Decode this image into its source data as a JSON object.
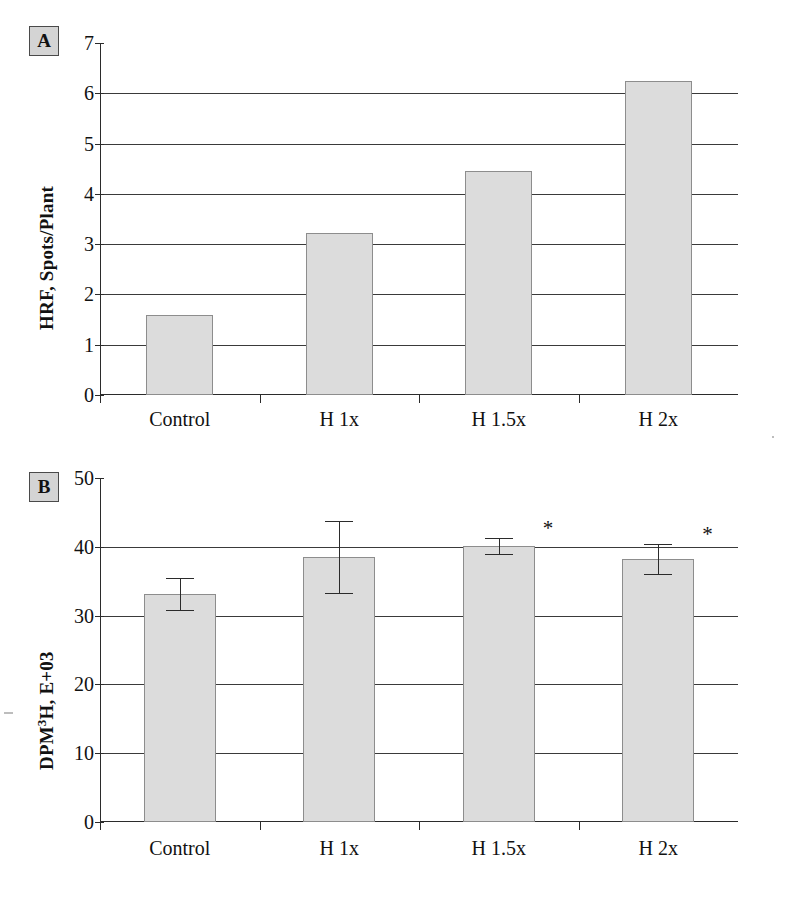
{
  "figure": {
    "background_color": "#ffffff",
    "bar_fill_color": "#dcdcdc",
    "bar_border_color": "#8d8d8d",
    "axis_color": "#2b2b2b"
  },
  "panels": [
    {
      "id": "A",
      "label": "A",
      "chart": {
        "type": "bar",
        "title": "",
        "subtitle": "",
        "xlabel": "",
        "ylabel": "HRF, Spots/Plant",
        "ylabel_html": "HRF, Spots/Plant",
        "categories": [
          "Control",
          "H 1x",
          "H 1.5x",
          "H 2x"
        ],
        "values": [
          1.6,
          3.22,
          4.45,
          6.25
        ],
        "series": [
          {
            "name": "HRF",
            "values": [
              1.6,
              3.22,
              4.45,
              6.25
            ]
          }
        ],
        "errors": null,
        "ylim": [
          0,
          7
        ],
        "ytick_values": [
          0,
          1,
          2,
          3,
          4,
          5,
          6,
          7
        ],
        "ytick_labels": [
          "0",
          "1",
          "2",
          "3",
          "4",
          "5",
          "6",
          "7"
        ],
        "grid": true,
        "grid_axis": "y",
        "legend": false,
        "legend_position": "none",
        "annotations": []
      }
    },
    {
      "id": "B",
      "label": "B",
      "chart": {
        "type": "bar",
        "title": "",
        "subtitle": "",
        "xlabel": "",
        "ylabel": "DPM3H, E+03",
        "ylabel_prefix": "DPM",
        "ylabel_superscript": "3",
        "ylabel_suffix": "H, E+03",
        "categories": [
          "Control",
          "H 1x",
          "H 1.5x",
          "H 2x"
        ],
        "values": [
          33.1,
          38.5,
          40.1,
          38.2
        ],
        "series": [
          {
            "name": "DPM 3H",
            "values": [
              33.1,
              38.5,
              40.1,
              38.2
            ]
          }
        ],
        "errors": [
          2.3,
          5.2,
          1.2,
          2.2
        ],
        "error_upper": [
          35.4,
          43.7,
          41.3,
          40.4
        ],
        "error_lower": [
          30.8,
          33.3,
          38.9,
          36.0
        ],
        "ylim": [
          0,
          50
        ],
        "ytick_values": [
          0,
          10,
          20,
          30,
          40,
          50
        ],
        "ytick_labels": [
          "0",
          "10",
          "20",
          "30",
          "40",
          "50"
        ],
        "grid": true,
        "grid_axis": "y",
        "legend": false,
        "legend_position": "none",
        "significance_marker": "*",
        "significance_categories": [
          "H 1.5x",
          "H 2x"
        ],
        "annotations": [
          {
            "text": "*",
            "category": "H 1.5x"
          },
          {
            "text": "*",
            "category": "H 2x"
          }
        ]
      }
    }
  ],
  "chart_data": [
    {
      "type": "bar",
      "panel": "A",
      "categories": [
        "Control",
        "H 1x",
        "H 1.5x",
        "H 2x"
      ],
      "values": [
        1.6,
        3.22,
        4.45,
        6.25
      ],
      "title": "",
      "xlabel": "",
      "ylabel": "HRF, Spots/Plant",
      "ylim": [
        0,
        7
      ],
      "yticks": [
        0,
        1,
        2,
        3,
        4,
        5,
        6,
        7
      ],
      "grid": true,
      "legend": "none"
    },
    {
      "type": "bar",
      "panel": "B",
      "categories": [
        "Control",
        "H 1x",
        "H 1.5x",
        "H 2x"
      ],
      "values": [
        33.1,
        38.5,
        40.1,
        38.2
      ],
      "errors": [
        2.3,
        5.2,
        1.2,
        2.2
      ],
      "title": "",
      "xlabel": "",
      "ylabel": "DPM3H, E+03",
      "ylim": [
        0,
        50
      ],
      "yticks": [
        0,
        10,
        20,
        30,
        40,
        50
      ],
      "grid": true,
      "legend": "none",
      "annotations": [
        "* on H 1.5x",
        "* on H 2x"
      ]
    }
  ]
}
